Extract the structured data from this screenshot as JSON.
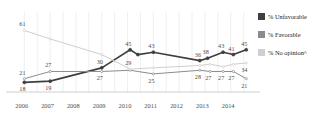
{
  "top_caption": "",
  "legend": {
    "position": "right",
    "items": [
      {
        "label": "% Unfavorable",
        "color": "#3f3f3f",
        "name": "unfavorable"
      },
      {
        "label": "% Favorable",
        "color": "#8c8c8c",
        "name": "favorable"
      },
      {
        "label": "% No opinion^",
        "color": "#cfcfcf",
        "name": "no-opinion"
      }
    ]
  },
  "chart_data": {
    "type": "line",
    "title": "",
    "subtitle": "",
    "xlabel": "",
    "ylabel": "",
    "grid": true,
    "ylim": [
      10,
      68
    ],
    "xlim": [
      2005.6,
      2014.9
    ],
    "x": [
      2006.0,
      2007.0,
      2009.0,
      2010.0,
      2010.3,
      2011.0,
      2012.8,
      2013.2,
      2013.7,
      2014.1,
      2014.6
    ],
    "tick_labels": [
      "2006",
      "2007",
      "2008",
      "2009",
      "2010",
      "2011",
      "2012",
      "2013",
      "2014"
    ],
    "tick_values": [
      2006,
      2007,
      2008,
      2009,
      2010,
      2011,
      2012,
      2013,
      2014
    ],
    "series": [
      {
        "name": "% Unfavorable",
        "color": "#3f3f3f",
        "points": [
          {
            "x": 2006.0,
            "y": 18,
            "label": "18",
            "label_pos": "below"
          },
          {
            "x": 2007.0,
            "y": 19,
            "label": "19",
            "label_pos": "below"
          },
          {
            "x": 2009.0,
            "y": 30,
            "label": "30",
            "label_pos": "above"
          },
          {
            "x": 2010.1,
            "y": 45,
            "label": "45",
            "label_pos": "above"
          },
          {
            "x": 2010.4,
            "y": 41,
            "label": "",
            "label_pos": "above"
          },
          {
            "x": 2011.0,
            "y": 43,
            "label": "43",
            "label_pos": "above"
          },
          {
            "x": 2012.8,
            "y": 36,
            "label": "36",
            "label_pos": "above"
          },
          {
            "x": 2013.1,
            "y": 38,
            "label": "38",
            "label_pos": "above"
          },
          {
            "x": 2013.7,
            "y": 43,
            "label": "43",
            "label_pos": "above"
          },
          {
            "x": 2014.1,
            "y": 41,
            "label": "41",
            "label_pos": "above"
          },
          {
            "x": 2014.6,
            "y": 45,
            "label": "45",
            "label_pos": "above"
          }
        ]
      },
      {
        "name": "% Favorable",
        "color": "#8c8c8c",
        "points": [
          {
            "x": 2006.0,
            "y": 21,
            "label": "21",
            "label_pos": "above"
          },
          {
            "x": 2007.0,
            "y": 27,
            "label": "27",
            "label_pos": "above"
          },
          {
            "x": 2009.0,
            "y": 27,
            "label": "27",
            "label_pos": "below"
          },
          {
            "x": 2010.1,
            "y": 28,
            "label": "",
            "label_pos": "below"
          },
          {
            "x": 2011.0,
            "y": 25,
            "label": "25",
            "label_pos": "below"
          },
          {
            "x": 2012.8,
            "y": 28,
            "label": "28",
            "label_pos": "below"
          },
          {
            "x": 2013.2,
            "y": 27,
            "label": "27",
            "label_pos": "below"
          },
          {
            "x": 2013.7,
            "y": 27,
            "label": "27",
            "label_pos": "below"
          },
          {
            "x": 2014.1,
            "y": 27,
            "label": "27",
            "label_pos": "below"
          },
          {
            "x": 2014.6,
            "y": 21,
            "label": "21",
            "label_pos": "below"
          }
        ]
      },
      {
        "name": "% No opinion^",
        "color": "#cfcfcf",
        "points": [
          {
            "x": 2006.0,
            "y": 61,
            "label": "61",
            "label_pos": "above"
          },
          {
            "x": 2007.0,
            "y": 54,
            "label": "",
            "label_pos": "above"
          },
          {
            "x": 2009.0,
            "y": 41,
            "label": "",
            "label_pos": "above"
          },
          {
            "x": 2010.1,
            "y": 29,
            "label": "29",
            "label_pos": "above"
          },
          {
            "x": 2011.0,
            "y": 30,
            "label": "",
            "label_pos": "above"
          },
          {
            "x": 2012.8,
            "y": 32,
            "label": "",
            "label_pos": "above"
          },
          {
            "x": 2013.2,
            "y": 33,
            "label": "",
            "label_pos": "above"
          },
          {
            "x": 2013.7,
            "y": 31,
            "label": "",
            "label_pos": "above"
          },
          {
            "x": 2014.1,
            "y": 33,
            "label": "",
            "label_pos": "above"
          },
          {
            "x": 2014.6,
            "y": 34,
            "label": "34",
            "label_pos": "below"
          }
        ]
      }
    ]
  }
}
